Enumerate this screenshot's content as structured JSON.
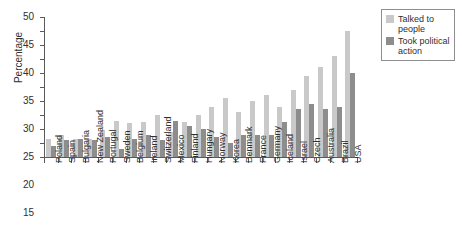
{
  "chart_data": {
    "type": "bar",
    "title": "",
    "xlabel": "",
    "ylabel": "Percentage",
    "ylim": [
      0,
      50
    ],
    "ytick_step": 5,
    "yticks": [
      0,
      5,
      10,
      15,
      20,
      25,
      30,
      35,
      40,
      45,
      50
    ],
    "grid": false,
    "legend_position": "top-right",
    "categories": [
      "Poland",
      "Spain",
      "Bulgaria",
      "New Zealand",
      "Portugal",
      "Sweden",
      "Belgium",
      "Ireland",
      "Switzerland",
      "Mexico",
      "Finland",
      "Hungary",
      "Norway",
      "Korea",
      "Denmark",
      "France",
      "Germany",
      "Iceland",
      "Israel",
      "Czech",
      "Australia",
      "Brazil",
      "USA"
    ],
    "series": [
      {
        "name": "Talked to people",
        "color": "#c9c9c9",
        "values": [
          6.5,
          8,
          6.5,
          6.5,
          9.5,
          13,
          12,
          12.5,
          15,
          9,
          12.5,
          15,
          18,
          21,
          16,
          20,
          22,
          18,
          24,
          29,
          32,
          36,
          45
        ]
      },
      {
        "name": "Took political action",
        "color": "#8d8d8d",
        "values": [
          4,
          6,
          6.5,
          6,
          7,
          3,
          6.5,
          8,
          6,
          13,
          11,
          10,
          7,
          5,
          8,
          8,
          8,
          12.5,
          17,
          19,
          17,
          18,
          30
        ]
      }
    ]
  },
  "legend": {
    "items": [
      {
        "label": "Talked to people",
        "color": "#c9c9c9"
      },
      {
        "label": "Took political action",
        "color": "#8d8d8d"
      }
    ]
  }
}
